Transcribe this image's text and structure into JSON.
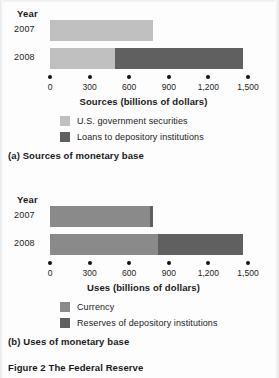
{
  "figure": {
    "caption": "Figure 2 The Federal Reserve"
  },
  "panel_a": {
    "year_header": "Year",
    "categories": [
      "2007",
      "2008"
    ],
    "axis_title": "Sources (billions of dollars)",
    "tick_labels": [
      "0",
      "300",
      "600",
      "900",
      "1,200",
      "1,500"
    ],
    "legend": [
      {
        "label": "U.S. government securities",
        "color": "#c0c0c0"
      },
      {
        "label": "Loans to depository institutions",
        "color": "#606060"
      }
    ],
    "sub_caption": "(a) Sources of monetary base"
  },
  "panel_b": {
    "year_header": "Year",
    "categories": [
      "2007",
      "2008"
    ],
    "axis_title": "Uses (billions of dollars)",
    "tick_labels": [
      "0",
      "300",
      "600",
      "900",
      "1,200",
      "1,500"
    ],
    "legend": [
      {
        "label": "Currency",
        "color": "#8a8a8a"
      },
      {
        "label": "Reserves of depository institutions",
        "color": "#606060"
      }
    ],
    "sub_caption": "(b) Uses of monetary base"
  },
  "chart_data": [
    {
      "type": "bar",
      "orientation": "horizontal",
      "stacked": true,
      "title": "(a) Sources of monetary base",
      "xlabel": "Sources (billions of dollars)",
      "ylabel": "Year",
      "categories": [
        "2007",
        "2008"
      ],
      "xlim": [
        0,
        1500
      ],
      "xticks": [
        0,
        300,
        600,
        900,
        1200,
        1500
      ],
      "xtick_labels": [
        "0",
        "300",
        "600",
        "900",
        "1,200",
        "1,500"
      ],
      "grid": false,
      "legend_position": "below",
      "series": [
        {
          "name": "U.S. government securities",
          "color": "#c0c0c0",
          "values": [
            780,
            490
          ]
        },
        {
          "name": "Loans to depository institutions",
          "color": "#606060",
          "values": [
            0,
            970
          ]
        }
      ],
      "totals": [
        780,
        1460
      ]
    },
    {
      "type": "bar",
      "orientation": "horizontal",
      "stacked": true,
      "title": "(b) Uses of monetary base",
      "xlabel": "Uses (billions of dollars)",
      "ylabel": "Year",
      "categories": [
        "2007",
        "2008"
      ],
      "xlim": [
        0,
        1500
      ],
      "xticks": [
        0,
        300,
        600,
        900,
        1200,
        1500
      ],
      "xtick_labels": [
        "0",
        "300",
        "600",
        "900",
        "1,200",
        "1,500"
      ],
      "grid": false,
      "legend_position": "below",
      "series": [
        {
          "name": "Currency",
          "color": "#8a8a8a",
          "values": [
            760,
            820
          ]
        },
        {
          "name": "Reserves of depository institutions",
          "color": "#606060",
          "values": [
            20,
            640
          ]
        }
      ],
      "totals": [
        780,
        1460
      ]
    }
  ]
}
